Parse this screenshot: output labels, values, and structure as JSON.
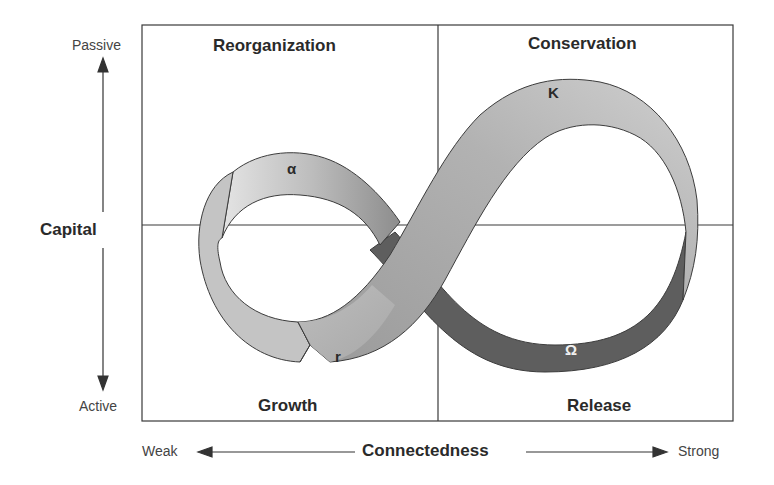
{
  "diagram": {
    "quadrants": {
      "top_left": "Reorganization",
      "top_right": "Conservation",
      "bottom_left": "Growth",
      "bottom_right": "Release"
    },
    "loop_labels": {
      "alpha": "α",
      "k": "K",
      "r": "r",
      "omega": "Ω"
    },
    "y_axis": {
      "label": "Capital",
      "top": "Passive",
      "bottom": "Active"
    },
    "x_axis": {
      "label": "Connectedness",
      "left": "Weak",
      "right": "Strong"
    },
    "colors": {
      "frame": "#3a3a3a",
      "band_light": "#c8c8c8",
      "band_mid": "#a9a9a9",
      "band_dark": "#5e5e5e",
      "band_outline": "#3c3c3c"
    }
  }
}
